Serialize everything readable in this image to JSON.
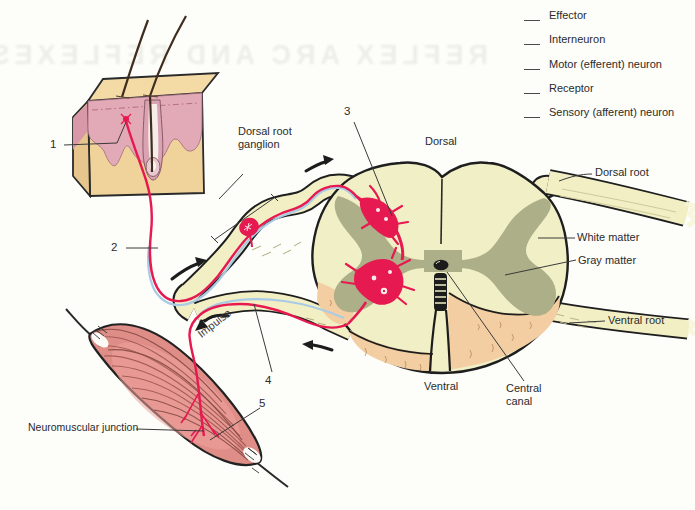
{
  "figure": {
    "bleedthrough_text": "REFLEX ARC AND REFLEXES",
    "legend": {
      "items": [
        "Effector",
        "Interneuron",
        "Motor (efferent) neuron",
        "Receptor",
        "Sensory (afferent) neuron"
      ]
    },
    "markers": {
      "m1": "1",
      "m2": "2",
      "m3": "3",
      "m4": "4",
      "m5": "5"
    },
    "labels": {
      "dorsal_root_ganglion": "Dorsal root ganglion",
      "dorsal": "Dorsal",
      "dorsal_root": "Dorsal root",
      "white_matter": "White matter",
      "gray_matter": "Gray matter",
      "ventral_root": "Ventral root",
      "ventral": "Ventral",
      "central_canal": "Central canal",
      "neuromuscular_junction": "Neuromuscular junction",
      "impulse": "Impulse"
    },
    "colors": {
      "nerve_cream": "#F2EFC4",
      "gray_matter_olive": "#ADAF88",
      "neuron_red": "#E61950",
      "sheath_blue": "#A9CBE5",
      "peach": "#F3CEA2",
      "muscle_pink": "#DF8D87",
      "skin_tan": "#F0D29B",
      "skin_pink": "#E2A9B6",
      "outline_black": "#1E1E1E"
    }
  }
}
